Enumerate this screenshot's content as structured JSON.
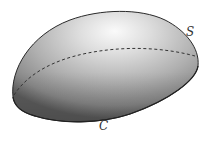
{
  "diagram": {
    "surface_label": "S",
    "curve_label": "C",
    "colors": {
      "surface_light": "#f4f4f4",
      "surface_mid": "#b8b8b8",
      "surface_dark": "#6a6a6a",
      "outline": "#2a2a2a",
      "dashed_curve": "#333333",
      "label": "#333333"
    }
  }
}
